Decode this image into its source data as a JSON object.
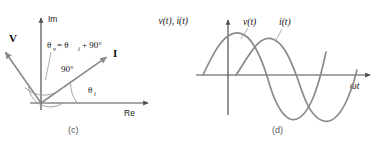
{
  "figure": {
    "panels": [
      {
        "id": "c",
        "caption": "(c)",
        "type": "phasor-diagram",
        "axes": {
          "imaginary_label": "Im",
          "real_label": "Re"
        },
        "vectors": [
          {
            "name": "V",
            "label": "V",
            "angle_deg": 125,
            "length": 62
          },
          {
            "name": "I",
            "label": "I",
            "angle_deg": 35,
            "length": 80
          }
        ],
        "annotations": [
          {
            "name": "theta-v-equation",
            "text": "θ",
            "sub": "v",
            "rest": " = θ",
            "sub2": "i",
            "tail": " + 90°"
          },
          {
            "name": "right-angle-label",
            "text": "90°"
          },
          {
            "name": "theta-i-label",
            "text": "θ",
            "sub": "i"
          }
        ]
      },
      {
        "id": "d",
        "caption": "(d)",
        "type": "waveform-plot",
        "axes": {
          "y_label": "v(t), i(t)",
          "x_label": "ωt"
        },
        "curves": [
          {
            "name": "voltage",
            "label": "v(t)",
            "phase_lead_deg": 90
          },
          {
            "name": "current",
            "label": "i(t)",
            "phase_lead_deg": 0
          }
        ]
      }
    ],
    "colors": {
      "stroke": "#808080",
      "axis": "#4d4d4d",
      "text": "#111111",
      "caption": "#555555",
      "background": "#ffffff"
    }
  }
}
